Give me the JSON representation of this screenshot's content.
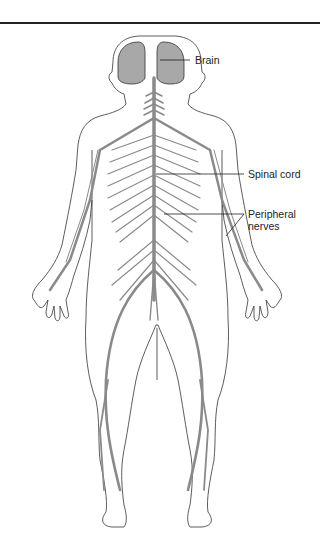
{
  "diagram": {
    "labels": [
      {
        "id": "brain",
        "text": "Brain"
      },
      {
        "id": "spinal_cord",
        "text": "Spinal cord"
      },
      {
        "id": "peripheral_nerves_line1",
        "text": "Peripheral"
      },
      {
        "id": "peripheral_nerves_line2",
        "text": "nerves"
      }
    ]
  },
  "colors": {
    "outline": "#333333",
    "nerve": "#8a8a8a",
    "brain_fill": "#a8a8a8"
  }
}
